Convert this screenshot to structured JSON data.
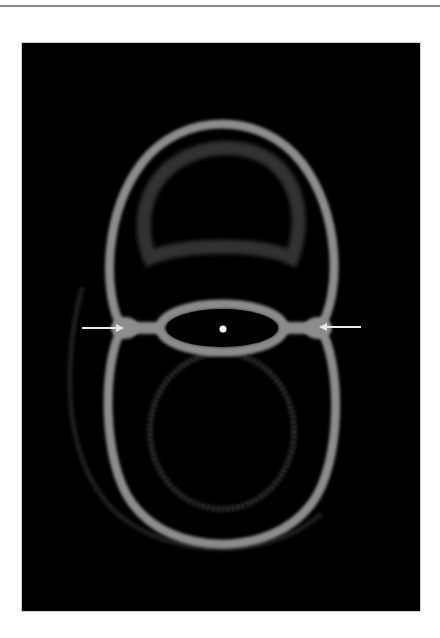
{
  "figure": {
    "background_color": "#000000",
    "page_color": "#ffffff",
    "rule_color": "#8a8a8a",
    "ring_color": "#8c8c8c",
    "faint_color": "#3a3a3a",
    "arrow_color": "#e8e8e8",
    "center_dot_color": "#ffffff",
    "elements": {
      "upper_ring": "upper bright ring",
      "lower_ring": "lower bright ring",
      "junction_ellipse": "central elliptical neck",
      "center_dot": "central bright point",
      "left_arrow": "arrow pointing right to left junction",
      "right_arrow": "arrow pointing left to right junction",
      "faint_upper_dome": "faint inner dome in upper ring",
      "faint_lower_circle": "faint inner circle in lower ring",
      "faint_outer_arc": "faint outer arc around lower ring"
    }
  }
}
